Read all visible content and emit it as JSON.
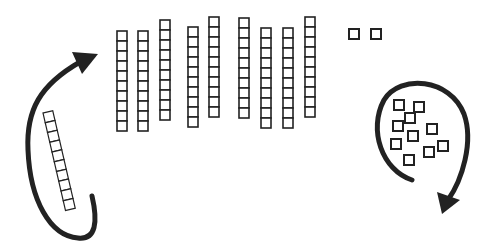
{
  "diagram": {
    "title": "Base-ten blocks regrouping",
    "colors": {
      "stroke": "#222222",
      "background": "#ffffff",
      "fill": "#ffffff"
    },
    "unit_size": 10,
    "tens_rods": [
      {
        "x": 117,
        "y": 31,
        "cells": 10
      },
      {
        "x": 138,
        "y": 31,
        "cells": 10
      },
      {
        "x": 160,
        "y": 20,
        "cells": 10
      },
      {
        "x": 188,
        "y": 27,
        "cells": 10
      },
      {
        "x": 209,
        "y": 17,
        "cells": 10
      },
      {
        "x": 239,
        "y": 18,
        "cells": 10
      },
      {
        "x": 261,
        "y": 28,
        "cells": 10
      },
      {
        "x": 283,
        "y": 28,
        "cells": 10
      },
      {
        "x": 305,
        "y": 17,
        "cells": 10
      }
    ],
    "loose_ones_top": [
      {
        "x": 349,
        "y": 29
      },
      {
        "x": 371,
        "y": 29
      }
    ],
    "decomposed_rod": {
      "x": 43,
      "y": 113,
      "cells": 10,
      "angle": -13
    },
    "regrouped_ones": [
      {
        "x": 394,
        "y": 100
      },
      {
        "x": 414,
        "y": 102
      },
      {
        "x": 405,
        "y": 113
      },
      {
        "x": 393,
        "y": 121
      },
      {
        "x": 427,
        "y": 124
      },
      {
        "x": 408,
        "y": 131
      },
      {
        "x": 391,
        "y": 139
      },
      {
        "x": 438,
        "y": 141
      },
      {
        "x": 424,
        "y": 147
      },
      {
        "x": 404,
        "y": 155
      }
    ],
    "counts": {
      "tens": 9,
      "ones_top": 2,
      "decomposed_ten": 1,
      "regrouped_ones": 10
    }
  }
}
